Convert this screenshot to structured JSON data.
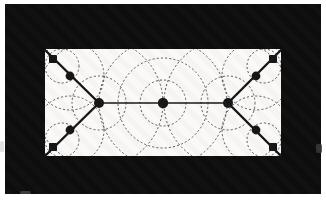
{
  "figure": {
    "canvas": {
      "width": 326,
      "height": 201,
      "margin_color": "#ffffff"
    },
    "black_panel": {
      "x": 5,
      "y": 4,
      "width": 316,
      "height": 190,
      "color": "#0d0d0d"
    },
    "white_rect": {
      "x": 45,
      "y": 49,
      "width": 236,
      "height": 107,
      "color": "#faf9f7"
    },
    "colors": {
      "ink": "#161616",
      "dash": "#474747"
    },
    "edges": [
      {
        "x1": 45,
        "y1": 50,
        "x2": 99,
        "y2": 103,
        "w": 2.4
      },
      {
        "x1": 45,
        "y1": 156,
        "x2": 99,
        "y2": 103,
        "w": 2.4
      },
      {
        "x1": 281,
        "y1": 50,
        "x2": 228,
        "y2": 103,
        "w": 2.4
      },
      {
        "x1": 281,
        "y1": 156,
        "x2": 228,
        "y2": 103,
        "w": 2.4
      },
      {
        "x1": 99,
        "y1": 103,
        "x2": 228,
        "y2": 103,
        "w": 1.7
      }
    ],
    "nodes": [
      {
        "x": 53,
        "y": 59,
        "shape": "square",
        "size": 8
      },
      {
        "x": 273,
        "y": 59,
        "shape": "square",
        "size": 8
      },
      {
        "x": 53,
        "y": 147,
        "shape": "square",
        "size": 8
      },
      {
        "x": 273,
        "y": 147,
        "shape": "square",
        "size": 8
      },
      {
        "x": 70,
        "y": 76,
        "shape": "circle",
        "r": 4.4
      },
      {
        "x": 256,
        "y": 76,
        "shape": "circle",
        "r": 4.4
      },
      {
        "x": 70,
        "y": 130,
        "shape": "circle",
        "r": 4.4
      },
      {
        "x": 256,
        "y": 130,
        "shape": "circle",
        "r": 4.4
      },
      {
        "x": 99,
        "y": 103,
        "shape": "circle",
        "r": 5.0
      },
      {
        "x": 163,
        "y": 103,
        "shape": "circle",
        "r": 5.2
      },
      {
        "x": 228,
        "y": 103,
        "shape": "circle",
        "r": 5.0
      }
    ],
    "dotted_circles": [
      {
        "cx": 163,
        "cy": 103,
        "r": 64
      },
      {
        "cx": 163,
        "cy": 103,
        "r": 45
      },
      {
        "cx": 163,
        "cy": 103,
        "r": 23
      },
      {
        "cx": 99,
        "cy": 103,
        "r": 64
      },
      {
        "cx": 228,
        "cy": 103,
        "r": 64
      },
      {
        "cx": 99,
        "cy": 103,
        "r": 27
      },
      {
        "cx": 228,
        "cy": 103,
        "r": 27
      },
      {
        "cx": 62,
        "cy": 66,
        "r": 17
      },
      {
        "cx": 62,
        "cy": 140,
        "r": 17
      },
      {
        "cx": 264,
        "cy": 66,
        "r": 17
      },
      {
        "cx": 264,
        "cy": 140,
        "r": 17
      },
      {
        "cx": 70,
        "cy": 76,
        "r": 34
      },
      {
        "cx": 70,
        "cy": 130,
        "r": 34
      },
      {
        "cx": 256,
        "cy": 76,
        "r": 34
      },
      {
        "cx": 256,
        "cy": 130,
        "r": 34
      }
    ],
    "artifacts": [
      {
        "x": 316,
        "y": 144,
        "w": 6,
        "h": 9,
        "color": "#3a3a3a"
      },
      {
        "x": 20,
        "y": 191,
        "w": 11,
        "h": 3,
        "color": "#454545"
      },
      {
        "x": 0,
        "y": 141,
        "w": 4,
        "h": 11,
        "color": "#d8d8d8"
      }
    ],
    "dash_pattern": "1.3 2.9"
  }
}
